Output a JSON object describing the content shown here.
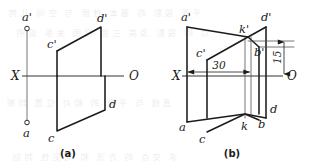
{
  "figure": {
    "kind": "descriptive-geometry-orthographic-projection",
    "canvas": {
      "width": 309,
      "height": 168,
      "background": "#ffffff"
    },
    "ink_color": "#1c1c1c",
    "panels": [
      {
        "id": "a",
        "caption": "(a)",
        "axis": {
          "left_label": "X",
          "right_label": "O"
        },
        "point_labels": [
          {
            "name": "a-prime",
            "text": "a'"
          },
          {
            "name": "c-prime",
            "text": "c'"
          },
          {
            "name": "d-prime",
            "text": "d'"
          },
          {
            "name": "a",
            "text": "a"
          },
          {
            "name": "c",
            "text": "c"
          },
          {
            "name": "d",
            "text": "d"
          }
        ],
        "markers": [
          {
            "name": "a-prime-point-marker"
          },
          {
            "name": "a-point-marker"
          }
        ]
      },
      {
        "id": "b",
        "caption": "(b)",
        "axis": {
          "left_label": "X",
          "right_label": "O"
        },
        "point_labels": [
          {
            "name": "a-prime",
            "text": "a'"
          },
          {
            "name": "c-prime",
            "text": "c'"
          },
          {
            "name": "d-prime",
            "text": "d'"
          },
          {
            "name": "k-prime",
            "text": "k'"
          },
          {
            "name": "b-prime",
            "text": "b'"
          },
          {
            "name": "a",
            "text": "a"
          },
          {
            "name": "c",
            "text": "c"
          },
          {
            "name": "d",
            "text": "d"
          },
          {
            "name": "k",
            "text": "k"
          },
          {
            "name": "b",
            "text": "b"
          }
        ],
        "dimensions": [
          {
            "name": "horizontal-dimension-30",
            "text": "30",
            "orientation": "horizontal"
          },
          {
            "name": "vertical-dimension-15",
            "text": "15",
            "orientation": "vertical"
          }
        ]
      }
    ]
  },
  "bleed_through": {
    "rows": [
      "平面 投影 的 基本 性质 与 空间 几何",
      "点 的 投影 及其 三面 视图 关系 说明",
      "直线 与 平面 的 相对 位置 判断",
      "求 交点 的 方法 和 可见性 判别"
    ]
  }
}
